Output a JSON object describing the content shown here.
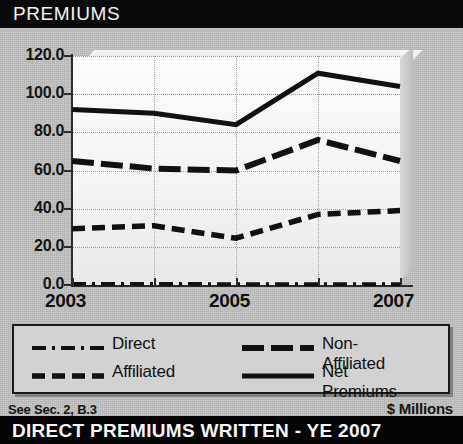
{
  "header": {
    "title": "PREMIUMS"
  },
  "footer": {
    "left_note": "See Sec. 2, B.3",
    "units": "$ Millions",
    "bottom_banner": "DIRECT PREMIUMS WRITTEN - YE 2007"
  },
  "axis": {
    "y_ticks": [
      "120.0",
      "100.0",
      "80.0",
      "60.0",
      "40.0",
      "20.0",
      "0.0"
    ],
    "x_ticks": [
      "2003",
      "2005",
      "2007"
    ]
  },
  "legend": {
    "items": [
      {
        "label": "Direct",
        "style": "dash-dot"
      },
      {
        "label": "Affiliated",
        "style": "dashed"
      },
      {
        "label": "Non-Affiliated",
        "style": "long-dash"
      },
      {
        "label": "Net Premiums",
        "style": "solid"
      }
    ]
  },
  "chart_data": {
    "type": "line",
    "title": "PREMIUMS",
    "xlabel": "",
    "ylabel": "$ Millions",
    "ylim": [
      0,
      120
    ],
    "yticks": [
      0,
      20,
      40,
      60,
      80,
      100,
      120
    ],
    "grid": true,
    "legend_position": "bottom",
    "categories": [
      "2003",
      "2004",
      "2005",
      "2006",
      "2007"
    ],
    "series": [
      {
        "name": "Direct",
        "style": "dash-dot",
        "values": [
          0.5,
          0.5,
          0.4,
          0.4,
          0.4
        ]
      },
      {
        "name": "Affiliated",
        "style": "dashed",
        "values": [
          29.5,
          31.0,
          24.5,
          37.0,
          39.0
        ]
      },
      {
        "name": "Non-Affiliated",
        "style": "long-dash",
        "values": [
          65.0,
          61.0,
          60.0,
          76.0,
          65.0
        ]
      },
      {
        "name": "Net Premiums",
        "style": "solid",
        "values": [
          92.0,
          90.0,
          84.0,
          111.0,
          104.0
        ]
      }
    ]
  },
  "colors": {
    "line": "#111111",
    "title_bar": "#0a0a0a",
    "panel": "#c2c2c2"
  }
}
